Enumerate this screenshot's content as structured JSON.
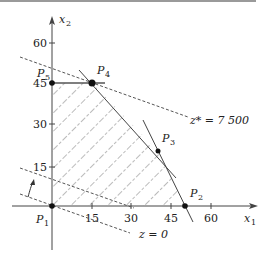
{
  "diagram": {
    "type": "linear-programming-feasible-region",
    "axes": {
      "x": {
        "label": "x",
        "subscript": "1",
        "ticks": [
          "15",
          "30",
          "45",
          "60"
        ]
      },
      "y": {
        "label": "x",
        "subscript": "2",
        "ticks": [
          "15",
          "30",
          "45",
          "60"
        ]
      }
    },
    "points": [
      {
        "name": "P",
        "sub": "1",
        "coords": [
          0,
          0
        ]
      },
      {
        "name": "P",
        "sub": "2",
        "coords": [
          50,
          0
        ]
      },
      {
        "name": "P",
        "sub": "3",
        "coords": [
          40,
          20
        ]
      },
      {
        "name": "P",
        "sub": "4",
        "coords": [
          15,
          45
        ]
      },
      {
        "name": "P",
        "sub": "5",
        "coords": [
          0,
          45
        ]
      }
    ],
    "objective_lines": [
      {
        "label": "z* = 7 500",
        "lhs": "z*",
        "rhs": "= 7 500"
      },
      {
        "label": "z = 0",
        "lhs": "z",
        "rhs": "= 0"
      }
    ],
    "region_fill": "hatched",
    "direction_arrow": "increasing z"
  }
}
